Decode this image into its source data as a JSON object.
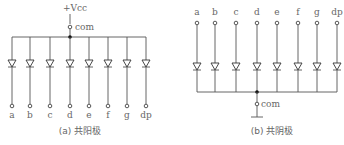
{
  "diagram_a": {
    "supply_label": "+Vcc",
    "com_label": "com",
    "segments": [
      "a",
      "b",
      "c",
      "d",
      "e",
      "f",
      "g",
      "dp"
    ],
    "caption": "(a) 共阳极"
  },
  "diagram_b": {
    "com_label": "com",
    "segments": [
      "a",
      "b",
      "c",
      "d",
      "e",
      "f",
      "g",
      "dp"
    ],
    "caption": "(b) 共阴极"
  }
}
